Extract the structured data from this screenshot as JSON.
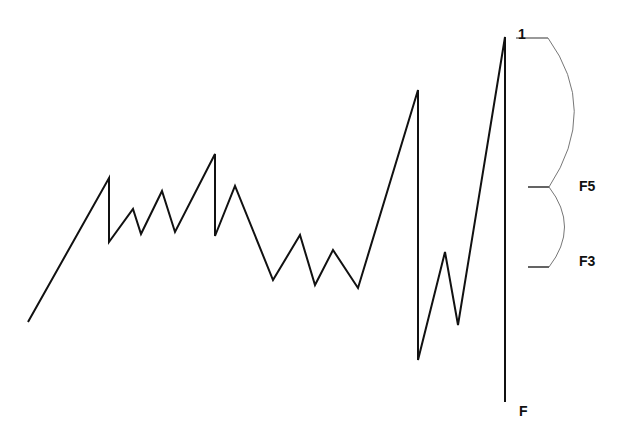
{
  "diagram": {
    "title": "",
    "price_path": {
      "color": "#111111",
      "stroke_width": 2,
      "points": [
        [
          28,
          322
        ],
        [
          109,
          178
        ],
        [
          109,
          242
        ],
        [
          133,
          209
        ],
        [
          141,
          234
        ],
        [
          162,
          191
        ],
        [
          175,
          232
        ],
        [
          215,
          154
        ],
        [
          215,
          236
        ],
        [
          235,
          186
        ],
        [
          273,
          280
        ],
        [
          300,
          235
        ],
        [
          315,
          285
        ],
        [
          333,
          250
        ],
        [
          358,
          288
        ],
        [
          418,
          90
        ],
        [
          418,
          360
        ],
        [
          445,
          252
        ],
        [
          458,
          325
        ],
        [
          505,
          37
        ],
        [
          505,
          402
        ]
      ]
    },
    "levels": [
      {
        "id": "level-1",
        "label": "1",
        "y": 38
      },
      {
        "id": "level-F5",
        "label": "F5",
        "y": 187
      },
      {
        "id": "level-F3",
        "label": "F3",
        "y": 267
      },
      {
        "id": "level-F",
        "label": "F",
        "y": 402
      }
    ],
    "brackets": [
      {
        "from": "1",
        "to": "F5"
      },
      {
        "from": "F5",
        "to": "F3"
      }
    ]
  },
  "labels": {
    "one": "1",
    "f5": "F5",
    "f3": "F3",
    "f": "F"
  }
}
